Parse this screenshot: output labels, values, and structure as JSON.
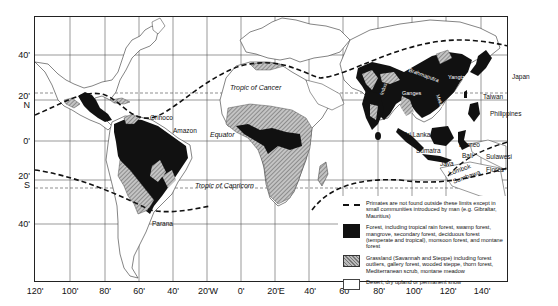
{
  "map": {
    "title": "Distribution of living primates in relation to vegetation zones",
    "latitude_labels": [
      {
        "text": "40'",
        "sub": "",
        "y": 51
      },
      {
        "text": "20'",
        "sub": "N",
        "y": 96
      },
      {
        "text": "0'",
        "sub": "",
        "y": 137
      },
      {
        "text": "20'",
        "sub": "S",
        "y": 176
      },
      {
        "text": "40'",
        "sub": "",
        "y": 220
      }
    ],
    "longitude_labels": [
      "120'",
      "100'",
      "80'",
      "60'",
      "40'",
      "20'W",
      "0'",
      "20'E",
      "40'",
      "60'",
      "80'",
      "100'",
      "120'",
      "140'"
    ],
    "reference_lines": {
      "tropic_cancer": "Tropic of Cancer",
      "equator": "Equator",
      "tropic_capricorn": "Tropic of Capricorn"
    },
    "place_labels": {
      "orinoco": "Orinoco",
      "amazon": "Amazon",
      "parana": "Parana",
      "brahmaputra": "Brahmaputra",
      "yangtze": "Yangtze",
      "ganges": "Ganges",
      "indus": "Indus",
      "mekong": "Mekong",
      "japan": "Japan",
      "taiwan": "Taiwan",
      "philippines": "Philippines",
      "sri_lanka": "Sri Lanka",
      "sumatra": "Sumatra",
      "borneo": "Borneo",
      "java": "Java",
      "bali": "Bali",
      "sulawesi": "Sulawesi",
      "lombok": "Lombok",
      "sumbawa": "Sumbawa",
      "flores": "Flores"
    }
  },
  "legend": {
    "items": [
      {
        "key": "primate-limit",
        "symbol": "dashed-line",
        "text": "Primates are not found outside these limits except in small communities introduced by man (e.g. Gibraltar, Mauritius)"
      },
      {
        "key": "forest",
        "symbol": "black-fill",
        "color": "#111111",
        "text": "Forest, including tropical rain forest, swamp forest, mangrove, secondary forest, deciduous forest (temperate and tropical), monsoon forest, and montane forest"
      },
      {
        "key": "grassland",
        "symbol": "hatched-grey",
        "color": "#999999",
        "text": "Grassland (Savannah and Steppe) including forest outliers, gallery forest, wooded steppe, thorn forest, Mediterranean scrub, montane meadow"
      },
      {
        "key": "desert",
        "symbol": "white-fill",
        "color": "#ffffff",
        "text": "Desert, dry upland or permanent snow"
      }
    ]
  }
}
